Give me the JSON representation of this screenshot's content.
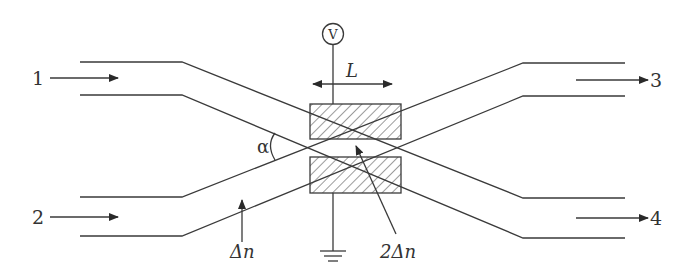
{
  "diagram": {
    "type": "electro-optic directional coupler switch (X-junction)",
    "colors": {
      "line": "#3a3a3a",
      "text": "#333333",
      "background": "#ffffff"
    },
    "ports": [
      {
        "id": "1",
        "label": "1",
        "side": "left-top",
        "direction": "input"
      },
      {
        "id": "2",
        "label": "2",
        "side": "left-bottom",
        "direction": "input"
      },
      {
        "id": "3",
        "label": "3",
        "side": "right-top",
        "direction": "output"
      },
      {
        "id": "4",
        "label": "4",
        "side": "right-bottom",
        "direction": "output"
      }
    ],
    "source": {
      "label": "V",
      "symbol": "voltage-source-circle"
    },
    "electrode_length_label": "L",
    "angle_label": "α",
    "index_labels": {
      "single": "Δn",
      "double": "2Δn"
    },
    "ground_symbol": "ground",
    "electrodes": [
      {
        "id": "top",
        "fill": "hatched"
      },
      {
        "id": "bottom",
        "fill": "hatched"
      }
    ]
  }
}
